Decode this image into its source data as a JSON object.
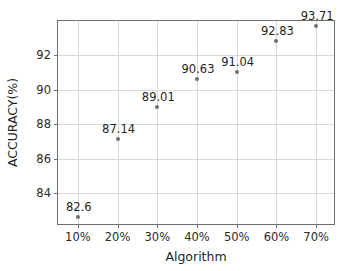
{
  "chart_data": {
    "type": "scatter",
    "title": "",
    "xlabel": "Algorithm",
    "ylabel": "ACCURACY(%)",
    "categories": [
      "10%",
      "20%",
      "30%",
      "40%",
      "50%",
      "60%",
      "70%"
    ],
    "x": [
      10,
      20,
      30,
      40,
      50,
      60,
      70
    ],
    "values": [
      82.6,
      87.14,
      89.01,
      90.63,
      91.04,
      92.83,
      93.71
    ],
    "point_labels": [
      "82.6",
      "87.14",
      "89.01",
      "90.63",
      "91.04",
      "92.83",
      "93.71"
    ],
    "xlim": [
      5,
      75
    ],
    "ylim": [
      82.1,
      94.0
    ],
    "xticks": [
      10,
      20,
      30,
      40,
      50,
      60,
      70
    ],
    "xtick_labels": [
      "10%",
      "20%",
      "30%",
      "40%",
      "50%",
      "60%",
      "70%"
    ],
    "yticks": [
      84,
      86,
      88,
      90,
      92
    ],
    "ytick_labels": [
      "84",
      "86",
      "88",
      "90",
      "92"
    ],
    "grid": true,
    "legend": false,
    "marker_color": "#707070",
    "grid_color": "#d9d9d9",
    "axis_color": "#6e6e6e",
    "text_color": "#1f1f1f",
    "background": "#ffffff"
  }
}
